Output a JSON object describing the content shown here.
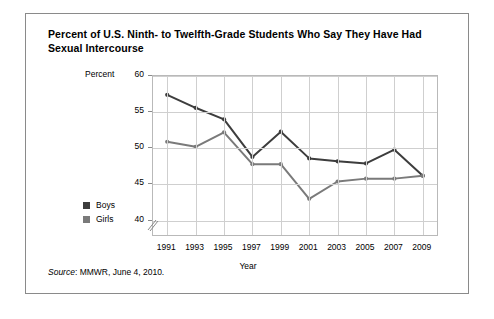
{
  "figure": {
    "title": "Percent of U.S. Ninth- to Twelfth-Grade Students Who Say They Have Had Sexual Intercourse",
    "source_word": "Source",
    "source_text": ": MMWR, June 4, 2010."
  },
  "chart_data": {
    "type": "line",
    "title": "Percent of U.S. Ninth- to Twelfth-Grade Students Who Say They Have Had Sexual Intercourse",
    "xlabel": "Year",
    "ylabel": "Percent",
    "categories": [
      "1991",
      "1993",
      "1995",
      "1997",
      "1999",
      "2001",
      "2003",
      "2005",
      "2007",
      "2009"
    ],
    "x": [
      1991,
      1993,
      1995,
      1997,
      1999,
      2001,
      2003,
      2005,
      2007,
      2009
    ],
    "series": [
      {
        "name": "Boys",
        "color": "#3d3d3d",
        "values": [
          57.4,
          55.6,
          54.0,
          48.8,
          52.3,
          48.6,
          48.2,
          47.9,
          49.8,
          46.2
        ]
      },
      {
        "name": "Girls",
        "color": "#7a7a7a",
        "values": [
          50.9,
          50.2,
          52.2,
          47.8,
          47.8,
          43.0,
          45.4,
          45.8,
          45.8,
          46.2
        ]
      }
    ],
    "ylim": [
      38,
      60
    ],
    "yticks": [
      40,
      45,
      50,
      55,
      60
    ],
    "ytick_labels": [
      "40",
      "45",
      "50",
      "55",
      "60"
    ],
    "axis_break": true,
    "grid": true,
    "legend_position": "left-outside"
  },
  "axes": {
    "y_title": "Percent",
    "x_title": "Year"
  },
  "legend": {
    "items": [
      {
        "label": "Boys",
        "color": "#3d3d3d"
      },
      {
        "label": "Girls",
        "color": "#7a7a7a"
      }
    ]
  }
}
